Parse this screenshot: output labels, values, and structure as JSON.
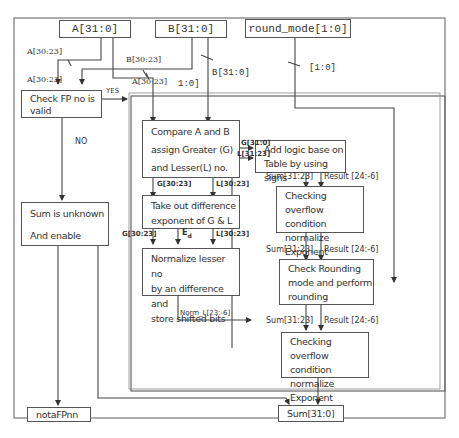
{
  "diagram": {
    "inputs": {
      "a": "A[31:0]",
      "b": "B[31:0]",
      "round_mode": "round_mode[1:0]"
    },
    "blocks": {
      "check_fp": [
        "Check FP no is",
        "valid"
      ],
      "sum_unknown": [
        "Sum is unknown",
        "And enable"
      ],
      "compare": [
        "Compare A and B",
        "assign Greater (G)",
        "and Lesser(L) no."
      ],
      "take_diff": [
        "Take out difference",
        "exponent of G & L"
      ],
      "normalize": [
        "Normalize lesser no",
        "by an difference and",
        "store shifted bits"
      ],
      "add_logic": [
        "Add logic base on",
        "Table by using signs"
      ],
      "overflow1": [
        "Checking overflow",
        "condition normalize",
        "Exponent"
      ],
      "rounding": [
        "Check Rounding",
        "mode and perform",
        "rounding"
      ],
      "overflow2": [
        "Checking overflow",
        "condition normalize",
        "Exponent"
      ]
    },
    "outputs": {
      "nota_fpnn": "notaFPnn",
      "sum": "Sum[31:0]"
    },
    "labels": {
      "a_exp_1": "A[30:23]",
      "a_exp_2": "A[30:23]",
      "a_exp_3": "A[30:23]",
      "b_exp": "B[30:23]",
      "b_full": "B[31:0]",
      "one_zero": "1:0]",
      "round_bits": "[1:0]",
      "yes": "YES",
      "no": "NO",
      "g_full": "G[31:0]",
      "l_sign": "L[31:23]",
      "g_exp_1": "G[30:23]",
      "l_exp_1": "L[30:23]",
      "g_exp_2": "G[30:23]",
      "ed": "E",
      "ed_sub": "d",
      "l_exp_2": "L[30:23]",
      "norm_l": "Norm_L[23:-6]",
      "sum_a": "Sum[31:23]",
      "result_a": "Result [24:-6]",
      "sum_b": "Sum[31:23]",
      "result_b": "Result [24:-6]",
      "sum_c": "Sum[31:23]",
      "result_c": "Result [24:-6]"
    }
  }
}
